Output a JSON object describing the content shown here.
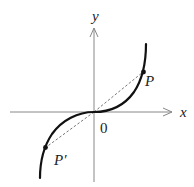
{
  "diagram": {
    "type": "function-graph",
    "axes": {
      "x_label": "x",
      "y_label": "y",
      "origin_label": "0"
    },
    "points": [
      {
        "id": "P",
        "label": "P"
      },
      {
        "id": "P_prime",
        "label": "P′"
      }
    ],
    "colors": {
      "axis": "#777777",
      "curve": "#111111",
      "dashed": "#666666",
      "text": "#222222"
    }
  }
}
